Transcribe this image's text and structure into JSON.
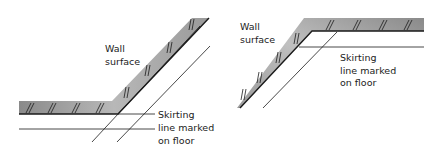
{
  "figure": {
    "left_diagram": {
      "title": "Internal corner (obtuse)",
      "labels": {
        "wall_line1": "Wall",
        "wall_line2": "surface",
        "skirting_line1": "Skirting",
        "skirting_line2": "line marked",
        "skirting_line3": "on floor"
      }
    },
    "right_diagram": {
      "title": "External corner (obtuse)",
      "labels": {
        "wall_line1": "Wall",
        "wall_line2": "surface",
        "skirting_line1": "Skirting",
        "skirting_line2": "line marked",
        "skirting_line3": "on floor"
      }
    }
  },
  "colors": {
    "wall_fill_dark": "#8a8a8a",
    "wall_fill_light": "#d4d4d4",
    "line": "#1a1a1a",
    "background": "#ffffff"
  }
}
